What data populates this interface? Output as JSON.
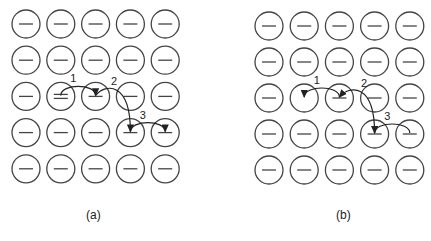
{
  "figure": {
    "panels": [
      {
        "id": "a",
        "caption": "(a)",
        "grid": {
          "rows": 5,
          "cols": 5,
          "origin": [
            26,
            24
          ],
          "spacing": [
            34.8,
            36.2
          ],
          "radius": 14
        },
        "double_dash_cell": [
          2,
          1
        ],
        "empty_cell": null,
        "arrows": [
          {
            "label": "1",
            "from": [
              2,
              1
            ],
            "to": [
              2,
              2
            ]
          },
          {
            "label": "2",
            "from": [
              2,
              2
            ],
            "to": [
              3,
              3
            ]
          },
          {
            "label": "3",
            "from": [
              3,
              3
            ],
            "to": [
              3,
              4
            ]
          }
        ]
      },
      {
        "id": "b",
        "caption": "(b)",
        "grid": {
          "rows": 5,
          "cols": 5,
          "origin": [
            269,
            26
          ],
          "spacing": [
            35.2,
            36
          ],
          "radius": 14
        },
        "double_dash_cell": null,
        "empty_cell": [
          2,
          1
        ],
        "arrows": [
          {
            "label": "1",
            "from": [
              2,
              2
            ],
            "to": [
              2,
              1
            ]
          },
          {
            "label": "2",
            "from": [
              3,
              3
            ],
            "to": [
              2,
              2
            ]
          },
          {
            "label": "3",
            "from": [
              3,
              4
            ],
            "to": [
              3,
              3
            ]
          }
        ]
      }
    ],
    "colors": {
      "stroke": "#444444",
      "arrow": "#222222",
      "background": "#ffffff"
    }
  }
}
